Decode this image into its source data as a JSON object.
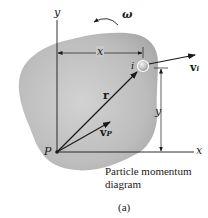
{
  "figure": {
    "caption_line1": "Particle momentum",
    "caption_line2": "diagram",
    "subfigure_label": "(a)"
  },
  "labels": {
    "y_axis": "y",
    "x_axis": "x",
    "omega": "ω",
    "x_dimension": "x",
    "y_dimension": "y",
    "particle": "i",
    "v_i_main": "v",
    "v_i_sub": "i",
    "r": "r",
    "v_p_main": "v",
    "v_p_sub": "P",
    "point_p": "P"
  },
  "colors": {
    "body_fill": "#b8b8b8",
    "line": "#1a1a1a",
    "background": "#ffffff"
  }
}
